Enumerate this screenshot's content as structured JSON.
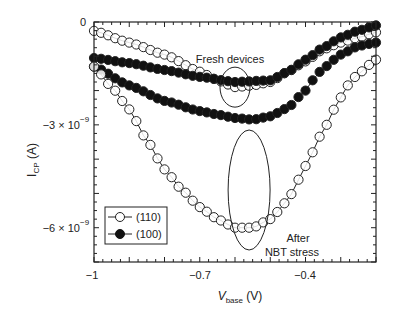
{
  "chart_data": {
    "type": "scatter",
    "title": "",
    "xlabel": "V_base (V)",
    "xlabel_main": "V",
    "xlabel_sub": "base",
    "xlabel_unit": " (V)",
    "ylabel": "I_CP (A)",
    "ylabel_main": "I",
    "ylabel_sub": "CP",
    "ylabel_unit": " (A)",
    "xlim": [
      -1.0,
      -0.2
    ],
    "ylim": [
      -7e-09,
      0
    ],
    "x_ticks": [
      {
        "value": -1.0,
        "label": "−1"
      },
      {
        "value": -0.7,
        "label": "−0.7"
      },
      {
        "value": -0.4,
        "label": "−0.4"
      }
    ],
    "y_ticks": [
      {
        "value": 0,
        "label": "0",
        "base": "0",
        "exp": ""
      },
      {
        "value": -3e-09,
        "label": "−3×10⁻⁹",
        "base": "−3 × 10",
        "exp": "−9"
      },
      {
        "value": -6e-09,
        "label": "−6×10⁻⁹",
        "base": "−6 × 10",
        "exp": "−9"
      }
    ],
    "grid": false,
    "legend": {
      "position": "bottom-left",
      "entries": [
        {
          "label": "(110)",
          "marker": "open-circle"
        },
        {
          "label": "(100)",
          "marker": "filled-circle"
        }
      ]
    },
    "annotations": [
      {
        "text": "Fresh devices",
        "near_x": -0.6,
        "near_y": -1e-09
      },
      {
        "text": "After",
        "near_x": -0.43,
        "near_y": -6e-09
      },
      {
        "text": "NBT stress",
        "near_x": -0.43,
        "near_y": -6.4e-09
      }
    ],
    "ellipses": [
      {
        "name": "fresh-ellipse",
        "center_x": -0.6,
        "center_y": -1.9e-09
      },
      {
        "name": "stress-ellipse",
        "center_x": -0.56,
        "center_y": -4.9e-09
      }
    ],
    "series": [
      {
        "name": "(110) fresh",
        "orientation": "(110)",
        "condition": "Fresh devices",
        "marker": "open-circle",
        "x": [
          -1.0,
          -0.9,
          -0.8,
          -0.7,
          -0.65,
          -0.6,
          -0.55,
          -0.5,
          -0.45,
          -0.4,
          -0.35,
          -0.3,
          -0.25,
          -0.2
        ],
        "y": [
          -2.6e-10,
          -6e-10,
          -9.5e-10,
          -1.45e-09,
          -1.7e-09,
          -1.9e-09,
          -1.85e-09,
          -1.75e-09,
          -1.45e-09,
          -1.15e-09,
          -8e-10,
          -6e-10,
          -4.5e-10,
          -3e-10
        ]
      },
      {
        "name": "(100) fresh",
        "orientation": "(100)",
        "condition": "Fresh devices",
        "marker": "filled-circle",
        "x": [
          -1.0,
          -0.9,
          -0.8,
          -0.7,
          -0.6,
          -0.5,
          -0.45,
          -0.4,
          -0.35,
          -0.3,
          -0.25,
          -0.2
        ],
        "y": [
          -1.05e-09,
          -1.2e-09,
          -1.4e-09,
          -1.6e-09,
          -1.75e-09,
          -1.7e-09,
          -1.45e-09,
          -1.1e-09,
          -7.5e-10,
          -4.5e-10,
          -2.5e-10,
          -1e-10
        ]
      },
      {
        "name": "(100) after NBT stress",
        "orientation": "(100)",
        "condition": "After NBT stress",
        "marker": "filled-circle",
        "x": [
          -1.0,
          -0.9,
          -0.8,
          -0.7,
          -0.65,
          -0.6,
          -0.55,
          -0.5,
          -0.45,
          -0.4,
          -0.38,
          -0.35,
          -0.3,
          -0.25,
          -0.2
        ],
        "y": [
          -1.3e-09,
          -1.85e-09,
          -2.3e-09,
          -2.6e-09,
          -2.7e-09,
          -2.8e-09,
          -2.85e-09,
          -2.75e-09,
          -2.5e-09,
          -2e-09,
          -1.7e-09,
          -1.35e-09,
          -9.5e-10,
          -7e-10,
          -6e-10
        ]
      },
      {
        "name": "(110) after NBT stress",
        "orientation": "(110)",
        "condition": "After NBT stress",
        "marker": "open-circle",
        "x": [
          -1.0,
          -0.95,
          -0.9,
          -0.85,
          -0.8,
          -0.75,
          -0.7,
          -0.65,
          -0.6,
          -0.55,
          -0.5,
          -0.45,
          -0.42,
          -0.38,
          -0.35,
          -0.3,
          -0.28,
          -0.25,
          -0.2
        ],
        "y": [
          -1.3e-09,
          -1.9e-09,
          -2.55e-09,
          -3.45e-09,
          -4.3e-09,
          -4.9e-09,
          -5.4e-09,
          -5.75e-09,
          -6e-09,
          -6e-09,
          -5.75e-09,
          -5.2e-09,
          -4.6e-09,
          -3.8e-09,
          -3.15e-09,
          -2.2e-09,
          -1.85e-09,
          -1.5e-09,
          -1.1e-09
        ]
      }
    ]
  }
}
